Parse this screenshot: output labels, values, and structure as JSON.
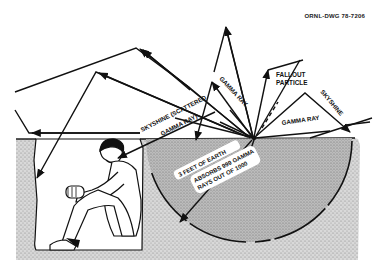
{
  "drawing_id": "ORNL-DWG 78-7206",
  "labels": {
    "skyshine_scattered_line1": "SKYSHINE (SCATTERED",
    "skyshine_scattered_line2": "GAMMA RAY)",
    "gamma_ray_upper": "GAMMA RAY",
    "fallout_line1": "FALLOUT",
    "fallout_line2": "PARTICLE",
    "gamma_ray_right": "GAMMA RAY",
    "skyshine_right": "SKYSHINE",
    "earth_line1": "3 FEET OF EARTH",
    "earth_line2": "ABSORBS 999 GAMMA",
    "earth_line3": "RAYS OUT OF 1000"
  },
  "colors": {
    "ink": "#111111",
    "soil": "#d6d6d6",
    "soil_dark": "#b9b9b9",
    "trench": "#ffffff"
  }
}
